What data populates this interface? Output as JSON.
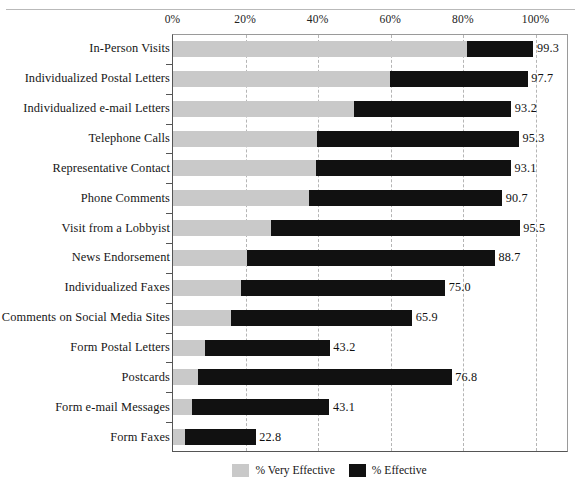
{
  "chart_data": {
    "type": "bar",
    "orientation": "horizontal",
    "stacked": true,
    "title": "",
    "subtitle": "",
    "xlabel": "",
    "ylabel": "",
    "xlim": [
      0,
      100
    ],
    "xticks": [
      0,
      20,
      40,
      60,
      80,
      100
    ],
    "xtick_labels": [
      "0%",
      "20%",
      "40%",
      "60%",
      "80%",
      "100%"
    ],
    "grid": true,
    "grid_axis": "x",
    "grid_style": "dashed",
    "legend_position": "bottom",
    "categories": [
      "In-Person Visits",
      "Individualized Postal Letters",
      "Individualized e-mail Letters",
      "Telephone Calls",
      "Representative Contact",
      "Phone Comments",
      "Visit from a Lobbyist",
      "News Endorsement",
      "Individualized Faxes",
      "Comments on Social Media Sites",
      "Form Postal Letters",
      "Postcards",
      "Form e-mail Messages",
      "Form Faxes"
    ],
    "series": [
      {
        "name": "% Very Effective",
        "color": "#c9c9c9",
        "values": [
          81.0,
          59.9,
          49.9,
          39.8,
          39.5,
          37.4,
          26.9,
          20.3,
          18.8,
          16.1,
          8.9,
          6.9,
          5.2,
          3.4
        ]
      },
      {
        "name": "% Effective",
        "color": "#111111",
        "values": [
          18.3,
          37.8,
          43.3,
          55.5,
          53.6,
          53.3,
          68.6,
          68.4,
          56.2,
          49.8,
          34.3,
          69.9,
          37.9,
          19.4
        ]
      }
    ],
    "totals": [
      99.3,
      97.7,
      93.2,
      95.3,
      93.1,
      90.7,
      95.5,
      88.7,
      75.0,
      65.9,
      43.2,
      76.8,
      43.1,
      22.8
    ],
    "total_labels": [
      "99.3",
      "97.7",
      "93.2",
      "95.3",
      "93.1",
      "90.7",
      "95.5",
      "88.7",
      "75.0",
      "65.9",
      "43.2",
      "76.8",
      "43.1",
      "22.8"
    ]
  },
  "legend": {
    "items": [
      {
        "label": "% Very Effective",
        "swatch": "very"
      },
      {
        "label": "% Effective",
        "swatch": "eff"
      }
    ]
  },
  "colors": {
    "very_effective": "#c9c9c9",
    "effective": "#111111",
    "gridline": "#b5b5b5",
    "axis": "#555555",
    "text": "#161616",
    "background": "#ffffff"
  }
}
